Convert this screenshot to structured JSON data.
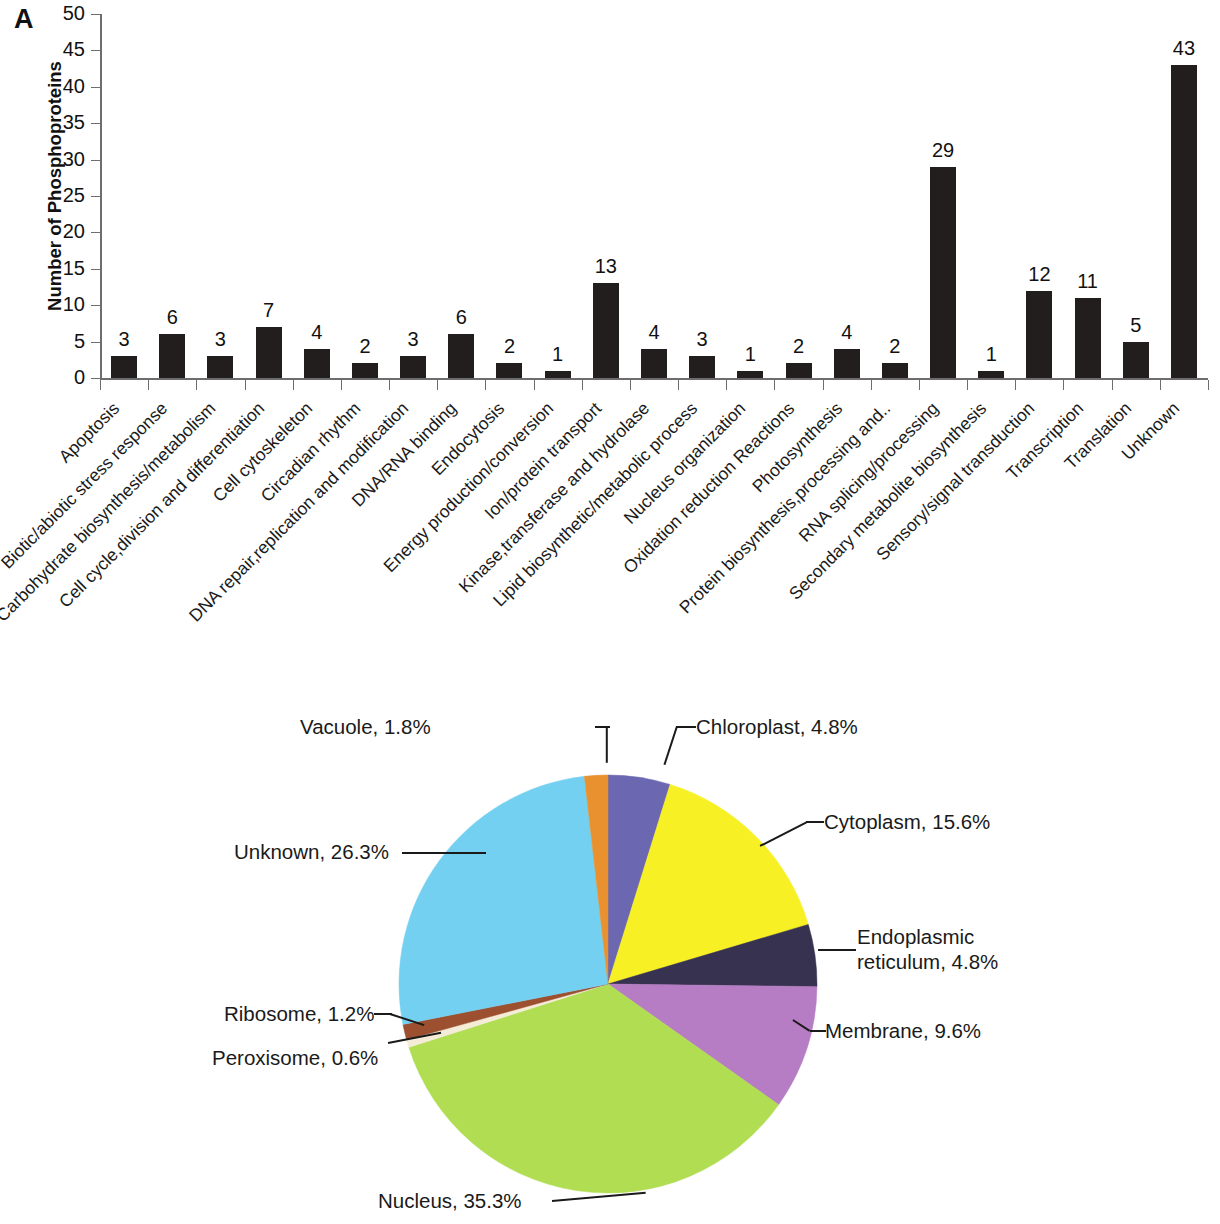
{
  "panels": {
    "a_letter": "A",
    "b_letter": "B"
  },
  "chart_data": [
    {
      "type": "bar",
      "panel": "A",
      "title": "",
      "xlabel": "",
      "ylabel": "Number of Phosphoproteins",
      "ylim": [
        0,
        50
      ],
      "ytick_labels": [
        "0",
        "5",
        "10",
        "15",
        "20",
        "25",
        "30",
        "35",
        "40",
        "45",
        "50"
      ],
      "ytick_values": [
        0,
        5,
        10,
        15,
        20,
        25,
        30,
        35,
        40,
        45,
        50
      ],
      "grid": false,
      "legend": false,
      "bar_color": "#221e1e",
      "categories": [
        "Apoptosis",
        "Biotic/abiotic stress response",
        "Carbohydrate biosynthesis/metabolism",
        "Cell cycle,division and differentiation",
        "Cell cytoskeleton",
        "Circadian rhythm",
        "DNA repair,replication and modification",
        "DNA/RNA binding",
        "Endocytosis",
        "Energy production/conversion",
        "Ion/protein transport",
        "Kinase,transferase and hydrolase",
        "Lipid biosynthetic/metabolic process",
        "Nucleus organization",
        "Oxidation reduction Reactions",
        "Photosynthesis",
        "Protein biosynthesis,processing and..",
        "RNA splicing/processing",
        "Secondary metabolite biosynthesis",
        "Sensory/signal transduction",
        "Transcription",
        "Translation",
        "Unknown"
      ],
      "values": [
        3,
        6,
        3,
        7,
        4,
        2,
        3,
        6,
        2,
        1,
        13,
        4,
        3,
        1,
        2,
        4,
        2,
        29,
        1,
        12,
        11,
        5,
        43
      ],
      "data_labels": [
        "3",
        "6",
        "3",
        "7",
        "4",
        "2",
        "3",
        "6",
        "2",
        "1",
        "13",
        "4",
        "3",
        "1",
        "2",
        "4",
        "2",
        "29",
        "1",
        "12",
        "11",
        "5",
        "43"
      ]
    },
    {
      "type": "pie",
      "panel": "B",
      "title": "",
      "legend": false,
      "label_format": "name, percent",
      "start_angle_deg": 0,
      "direction": "clockwise",
      "slices": [
        {
          "name": "Chloroplast",
          "value": 4.8,
          "label": "Chloroplast, 4.8%",
          "color": "#6b67b0"
        },
        {
          "name": "Cytoplasm",
          "value": 15.6,
          "label": "Cytoplasm, 15.6%",
          "color": "#f7f024"
        },
        {
          "name": "Endoplasmic reticulum",
          "value": 4.8,
          "label": "Endoplasmic reticulum, 4.8%",
          "color": "#36324f"
        },
        {
          "name": "Membrane",
          "value": 9.6,
          "label": "Membrane, 9.6%",
          "color": "#b67cc4"
        },
        {
          "name": "Nucleus",
          "value": 35.3,
          "label": "Nucleus, 35.3%",
          "color": "#b0dd52"
        },
        {
          "name": "Peroxisome",
          "value": 0.6,
          "label": "Peroxisome, 0.6%",
          "color": "#f5ecd8"
        },
        {
          "name": "Ribosome",
          "value": 1.2,
          "label": "Ribosome, 1.2%",
          "color": "#9c5030"
        },
        {
          "name": "Unknown",
          "value": 26.3,
          "label": "Unknown, 26.3%",
          "color": "#74d0f0"
        },
        {
          "name": "Vacuole",
          "value": 1.8,
          "label": "Vacuole, 1.8%",
          "color": "#e8912e"
        }
      ],
      "labels_text": {
        "vacuole": "Vacuole, 1.8%",
        "chloroplast": "Chloroplast, 4.8%",
        "cytoplasm": "Cytoplasm, 15.6%",
        "endoplasmic_reticulum_line1": "Endoplasmic",
        "endoplasmic_reticulum_line2": "reticulum, 4.8%",
        "membrane": "Membrane, 9.6%",
        "nucleus": "Nucleus, 35.3%",
        "peroxisome": "Peroxisome, 0.6%",
        "ribosome": "Ribosome, 1.2%",
        "unknown": "Unknown, 26.3%"
      }
    }
  ]
}
